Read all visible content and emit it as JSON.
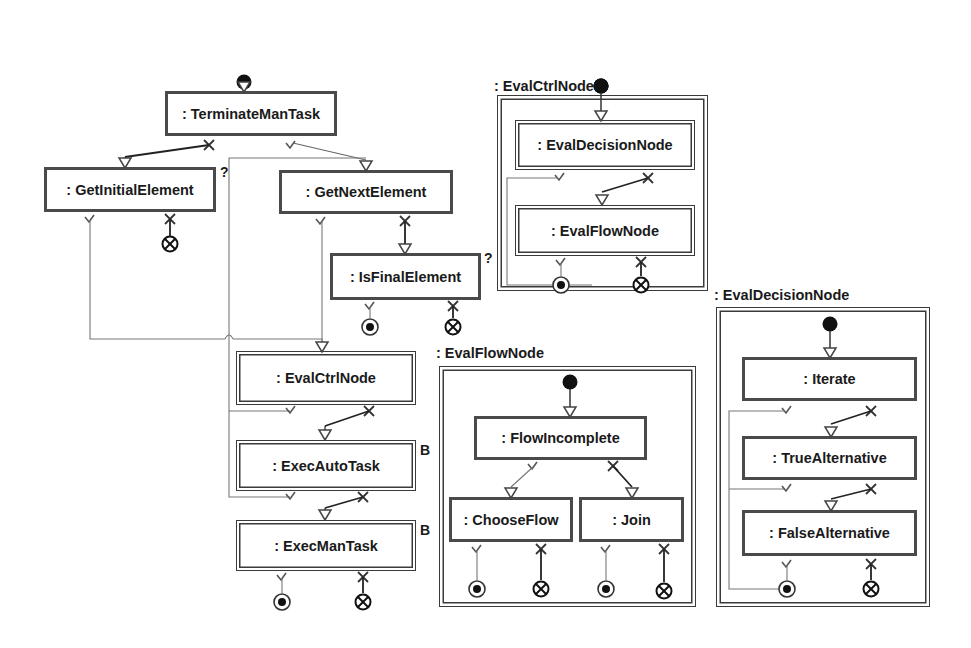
{
  "diagram": {
    "main_flow": {
      "nodes": [
        {
          "id": "terminate",
          "label": ": TerminateManTask",
          "type": "simple"
        },
        {
          "id": "get_initial",
          "label": ": GetInitialElement",
          "type": "simple",
          "marker": "?"
        },
        {
          "id": "get_next",
          "label": ": GetNextElement",
          "type": "simple"
        },
        {
          "id": "is_final",
          "label": ": IsFinalElement",
          "type": "simple",
          "marker": "?"
        },
        {
          "id": "eval_ctrl",
          "label": ": EvalCtrlNode",
          "type": "composite"
        },
        {
          "id": "exec_auto",
          "label": ": ExecAutoTask",
          "type": "composite",
          "marker": "B"
        },
        {
          "id": "exec_man",
          "label": ": ExecManTask",
          "type": "composite",
          "marker": "B"
        }
      ]
    },
    "containers": [
      {
        "id": "eval_ctrl_node",
        "label": ": EvalCtrlNode",
        "nodes": [
          {
            "id": "ecn_decision",
            "label": ": EvalDecisionNode",
            "type": "composite"
          },
          {
            "id": "ecn_flow",
            "label": ": EvalFlowNode",
            "type": "composite"
          }
        ]
      },
      {
        "id": "eval_flow_node",
        "label": ": EvalFlowNode",
        "nodes": [
          {
            "id": "efn_incomplete",
            "label": ": FlowIncomplete",
            "type": "simple"
          },
          {
            "id": "efn_choose",
            "label": ": ChooseFlow",
            "type": "simple"
          },
          {
            "id": "efn_join",
            "label": ": Join",
            "type": "simple"
          }
        ]
      },
      {
        "id": "eval_decision_node",
        "label": ": EvalDecisionNode",
        "nodes": [
          {
            "id": "edn_iterate",
            "label": ": Iterate",
            "type": "simple"
          },
          {
            "id": "edn_true",
            "label": ": TrueAlternative",
            "type": "simple"
          },
          {
            "id": "edn_false",
            "label": ": FalseAlternative",
            "type": "simple"
          }
        ]
      }
    ],
    "legend_symbols": {
      "start": "filled-circle",
      "success_end": "bullseye",
      "failure_end": "circled-x",
      "success_port": "check",
      "failure_port": "cross"
    }
  }
}
